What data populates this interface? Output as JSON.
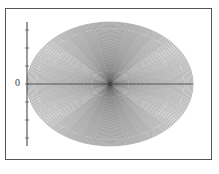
{
  "figure": {
    "name": "nested-ellipse-envelope-plot",
    "background_color": "#ffffff",
    "frame_color": "#555555",
    "curve_color": "#2b2b2b",
    "axis_color": "#4a4a4a",
    "origin_label": "0",
    "caption": ""
  },
  "chart_data": {
    "type": "line",
    "title": "",
    "subtitle": "",
    "xlabel": "",
    "ylabel": "",
    "xlim": [
      -1.12,
      1.12
    ],
    "ylim": [
      -1.0,
      1.0
    ],
    "grid": false,
    "legend": "none",
    "tick_labels": {
      "x": [],
      "y": [
        "0"
      ]
    },
    "annotations": [
      {
        "text": "0",
        "x": -1.06,
        "y": 0.0,
        "note": "origin tick label on vertical axis"
      }
    ],
    "series": [
      {
        "name": "ellipse-family",
        "kind": "parametric-ellipse-family",
        "count": 110,
        "center": [
          0.0,
          0.0
        ],
        "semi_axis_x_range": [
          0.012,
          1.0
        ],
        "semi_axis_y_range": [
          0.012,
          0.86
        ],
        "rotation_deg_range": [
          0,
          0
        ],
        "stroke_width": 0.35
      }
    ],
    "axes_lines": [
      {
        "name": "x-axis",
        "from": [
          -1.0,
          0.0
        ],
        "to": [
          1.0,
          0.0
        ]
      },
      {
        "name": "y-axis",
        "from": [
          -1.0,
          -0.86
        ],
        "to": [
          -1.0,
          0.86
        ]
      }
    ],
    "y_axis_ticks": [
      -0.75,
      -0.5,
      -0.25,
      0.0,
      0.25,
      0.5,
      0.75
    ]
  }
}
